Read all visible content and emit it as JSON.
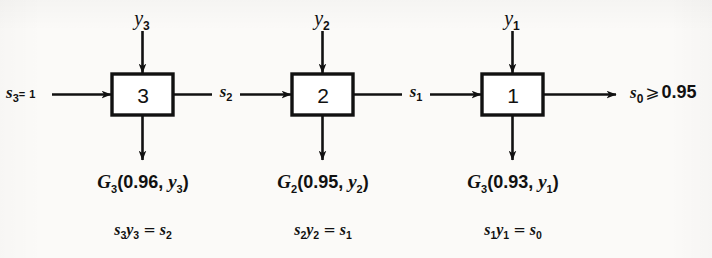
{
  "diagram": {
    "type": "block-flow-diagram",
    "ink_color": "#111111",
    "background_color": "#fbfaf8",
    "source": {
      "label_var": "s",
      "label_sub": "3",
      "label_eq": "= 1",
      "full_text": "s3 = 1"
    },
    "sink": {
      "label_var": "s",
      "label_sub": "0",
      "relation": "⩾",
      "value": "0.95",
      "full_text": "s0 ⩾ 0.95"
    },
    "stages": [
      {
        "box_label": "3",
        "input_var": "y",
        "input_sub": "3",
        "output_flow_var": "s",
        "output_flow_sub": "2",
        "return_fn": "G",
        "return_fn_sub": "3",
        "return_args": "(0.96, ",
        "return_arg_var": "y",
        "return_arg_sub": "3",
        "return_close": ")",
        "return_value": "0.96",
        "equation": {
          "lhs_a_var": "s",
          "lhs_a_sub": "3",
          "lhs_b_var": "y",
          "lhs_b_sub": "3",
          "op": "=",
          "rhs_var": "s",
          "rhs_sub": "2",
          "full_text": "s3 y3 = s2"
        }
      },
      {
        "box_label": "2",
        "input_var": "y",
        "input_sub": "2",
        "output_flow_var": "s",
        "output_flow_sub": "1",
        "return_fn": "G",
        "return_fn_sub": "2",
        "return_args": "(0.95, ",
        "return_arg_var": "y",
        "return_arg_sub": "2",
        "return_close": ")",
        "return_value": "0.95",
        "equation": {
          "lhs_a_var": "s",
          "lhs_a_sub": "2",
          "lhs_b_var": "y",
          "lhs_b_sub": "2",
          "op": "=",
          "rhs_var": "s",
          "rhs_sub": "1",
          "full_text": "s2 y2 = s1"
        }
      },
      {
        "box_label": "1",
        "input_var": "y",
        "input_sub": "1",
        "output_flow_var": "s",
        "output_flow_sub": "0",
        "return_fn": "G",
        "return_fn_sub": "3",
        "return_args": "(0.93, ",
        "return_arg_var": "y",
        "return_arg_sub": "1",
        "return_close": ")",
        "return_value": "0.93",
        "equation": {
          "lhs_a_var": "s",
          "lhs_a_sub": "1",
          "lhs_b_var": "y",
          "lhs_b_sub": "1",
          "op": "=",
          "rhs_var": "s",
          "rhs_sub": "0",
          "full_text": "s1 y1 = s0"
        }
      }
    ]
  }
}
